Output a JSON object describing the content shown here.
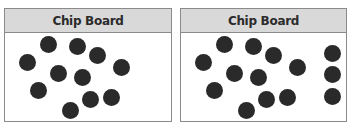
{
  "boards": [
    {
      "title": "Chip Board",
      "chip_color": "#2a2a2a",
      "chip_count": 11,
      "chips": [
        [
          48,
          44
        ],
        [
          77,
          46
        ],
        [
          97,
          55
        ],
        [
          27,
          62
        ],
        [
          121,
          67
        ],
        [
          58,
          73
        ],
        [
          82,
          77
        ],
        [
          38,
          90
        ],
        [
          90,
          99
        ],
        [
          111,
          97
        ],
        [
          70,
          110
        ]
      ]
    },
    {
      "title": "Chip Board",
      "chip_color": "#2a2a2a",
      "chip_count": 14,
      "chips": [
        [
          224,
          44
        ],
        [
          253,
          46
        ],
        [
          273,
          55
        ],
        [
          203,
          62
        ],
        [
          297,
          67
        ],
        [
          234,
          73
        ],
        [
          258,
          77
        ],
        [
          214,
          90
        ],
        [
          266,
          99
        ],
        [
          287,
          97
        ],
        [
          246,
          110
        ],
        [
          332,
          53
        ],
        [
          332,
          74
        ],
        [
          332,
          96
        ]
      ]
    }
  ]
}
